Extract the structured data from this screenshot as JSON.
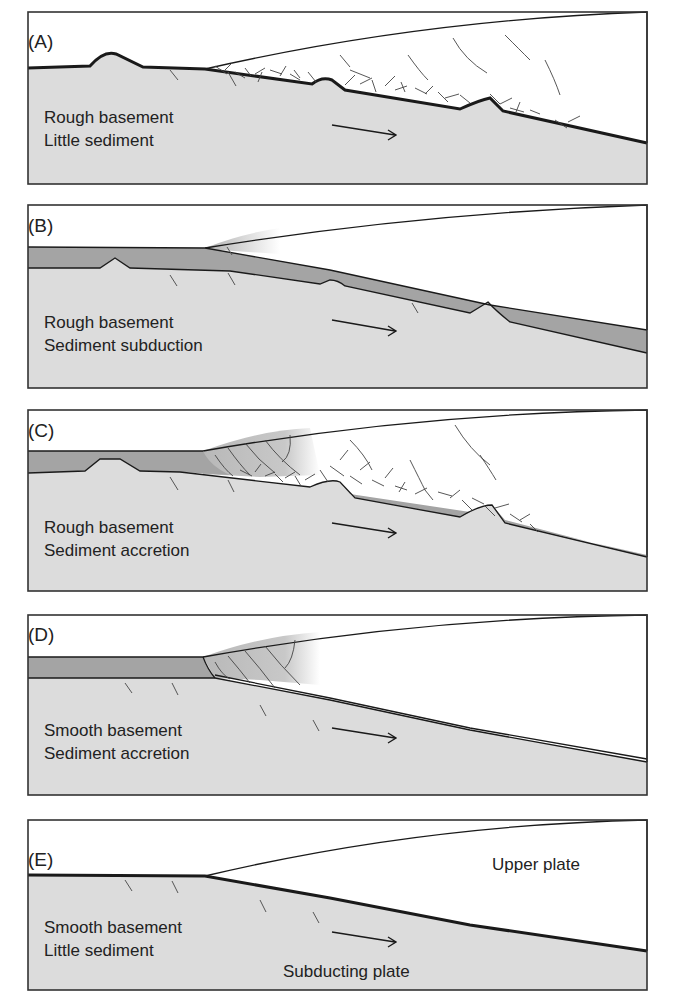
{
  "figure": {
    "panels": [
      {
        "id": "A",
        "label": "(A)",
        "lines": [
          "Rough basement",
          "Little sediment"
        ]
      },
      {
        "id": "B",
        "label": "(B)",
        "lines": [
          "Rough basement",
          "Sediment subduction"
        ]
      },
      {
        "id": "C",
        "label": "(C)",
        "lines": [
          "Rough basement",
          "Sediment accretion"
        ]
      },
      {
        "id": "D",
        "label": "(D)",
        "lines": [
          "Smooth basement",
          "Sediment accretion"
        ]
      },
      {
        "id": "E",
        "label": "(E)",
        "lines": [
          "Smooth basement",
          "Little sediment"
        ],
        "upper_plate": "Upper plate",
        "subducting_plate": "Subducting plate"
      }
    ],
    "colors": {
      "basement": "#dcdcdc",
      "sediment": "#a4a4a4",
      "accretionary_wedge": "#c8c8c8",
      "upper_plate": "#ffffff",
      "outline": "#1a1a1a"
    }
  }
}
